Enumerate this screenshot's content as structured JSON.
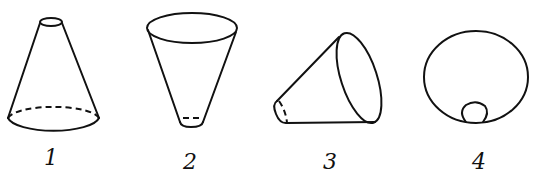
{
  "diagram": {
    "figures": [
      {
        "id": 1,
        "label": "1",
        "orientation": "upright, small end up"
      },
      {
        "id": 2,
        "label": "2",
        "orientation": "inverted, wide end up"
      },
      {
        "id": 3,
        "label": "3",
        "orientation": "lying on side, wide end right"
      },
      {
        "id": 4,
        "label": "4",
        "orientation": "viewed from wide end (top view)"
      }
    ],
    "stroke_color": "#111111",
    "background": "#ffffff"
  }
}
